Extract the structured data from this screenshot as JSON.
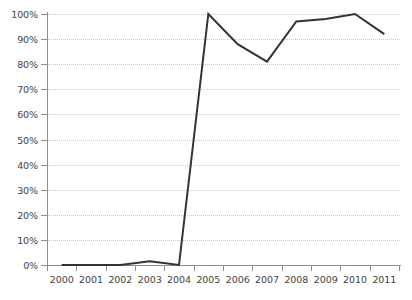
{
  "chart_data": {
    "type": "line",
    "title": "",
    "subtitle": "",
    "xlabel": "",
    "ylabel": "",
    "categories": [
      "2000",
      "2001",
      "2002",
      "2003",
      "2004",
      "2005",
      "2006",
      "2007",
      "2008",
      "2009",
      "2010",
      "2011"
    ],
    "values": [
      0,
      0,
      0,
      1.5,
      0,
      100,
      88,
      81,
      97,
      98,
      100,
      92
    ],
    "series": [
      {
        "name": "",
        "values": [
          0,
          0,
          0,
          1.5,
          0,
          100,
          88,
          81,
          97,
          98,
          100,
          92
        ]
      }
    ],
    "ylim": [
      0,
      100
    ],
    "y_ticks": [
      0,
      10,
      20,
      30,
      40,
      50,
      60,
      70,
      80,
      90,
      100
    ],
    "y_tick_labels": [
      "0%",
      "10%",
      "20%",
      "30%",
      "40%",
      "50%",
      "60%",
      "70%",
      "80%",
      "90%",
      "100%"
    ],
    "x_tick_labels": [
      "2000",
      "2001",
      "2002",
      "2003",
      "2004",
      "2005",
      "2006",
      "2007",
      "2008",
      "2009",
      "2010",
      "2011"
    ],
    "grid": true,
    "grid_axis": "y",
    "grid_style": "dotted",
    "legend": false,
    "legend_position": "none",
    "annotations": [],
    "colors": {
      "line": "#333333",
      "grid": "#c9c9c9",
      "axis": "#8d8d8d",
      "text": "#3f3f3f",
      "background": "#ffffff"
    },
    "line_width": 2
  }
}
